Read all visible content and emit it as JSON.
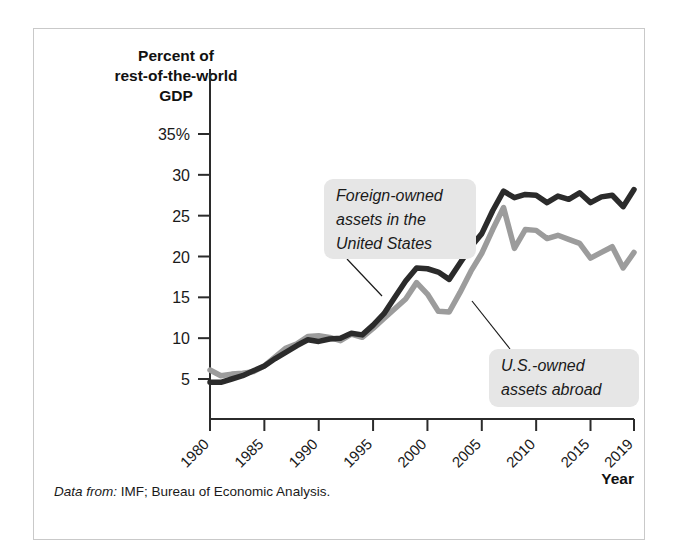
{
  "figure": {
    "source_lead": "Data from:",
    "source_text": "IMF; Bureau of Economic Analysis."
  },
  "chart_data": {
    "type": "line",
    "title": "",
    "ylabel": "Percent of rest-of-the-world GDP",
    "ylabel_lines": [
      "Percent of",
      "rest-of-the-world",
      "GDP"
    ],
    "xlabel": "Year",
    "ylim": [
      0,
      35
    ],
    "xlim": [
      1980,
      2019
    ],
    "grid": false,
    "legend_position": "annotations-on-plot",
    "ytick_labels": [
      "35%",
      "30",
      "25",
      "20",
      "15",
      "10",
      "5"
    ],
    "yticks": [
      35,
      30,
      25,
      20,
      15,
      10,
      5
    ],
    "xtick_labels": [
      "1980",
      "1985",
      "1990",
      "1995",
      "2000",
      "2005",
      "2010",
      "2015",
      "2019"
    ],
    "xticks": [
      1980,
      1985,
      1990,
      1995,
      2000,
      2005,
      2010,
      2015,
      2019
    ],
    "x": [
      1980,
      1981,
      1982,
      1983,
      1984,
      1985,
      1986,
      1987,
      1988,
      1989,
      1990,
      1991,
      1992,
      1993,
      1994,
      1995,
      1996,
      1997,
      1998,
      1999,
      2000,
      2001,
      2002,
      2003,
      2004,
      2005,
      2006,
      2007,
      2008,
      2009,
      2010,
      2011,
      2012,
      2013,
      2014,
      2015,
      2016,
      2017,
      2018,
      2019
    ],
    "series": [
      {
        "name": "Foreign-owned assets in the United States",
        "color": "#2b2b2b",
        "stroke_width": 5.5,
        "values": [
          4.6,
          4.6,
          5.0,
          5.4,
          6.0,
          6.6,
          7.5,
          8.3,
          9.1,
          9.8,
          9.6,
          9.9,
          10.0,
          10.6,
          10.4,
          11.6,
          13.0,
          15.0,
          17.0,
          18.6,
          18.5,
          18.1,
          17.2,
          19.2,
          21.2,
          22.8,
          25.6,
          28.0,
          27.2,
          27.6,
          27.5,
          26.6,
          27.4,
          27.0,
          27.8,
          26.6,
          27.3,
          27.5,
          26.1,
          28.2
        ]
      },
      {
        "name": "U.S.-owned assets abroad",
        "color": "#9c9c9c",
        "stroke_width": 5.5,
        "values": [
          6.1,
          5.4,
          5.6,
          5.7,
          5.9,
          6.6,
          7.7,
          8.8,
          9.3,
          10.2,
          10.3,
          10.1,
          9.7,
          10.5,
          10.1,
          11.2,
          12.4,
          13.6,
          14.8,
          16.8,
          15.4,
          13.3,
          13.2,
          15.6,
          18.2,
          20.4,
          23.3,
          26.0,
          21.0,
          23.3,
          23.2,
          22.2,
          22.6,
          22.1,
          21.6,
          19.8,
          20.5,
          21.2,
          18.6,
          20.5
        ]
      }
    ],
    "annotations": [
      {
        "id": "foreign-owned-callout",
        "lines": [
          "Foreign-owned",
          "assets in the",
          "United States"
        ],
        "box": {
          "x": 290,
          "y": 150,
          "w": 152,
          "h": 80
        },
        "leader": {
          "x1": 313,
          "y1": 230,
          "x2": 348,
          "y2": 267
        }
      },
      {
        "id": "us-owned-callout",
        "lines": [
          "U.S.-owned",
          "assets abroad"
        ],
        "box": {
          "x": 455,
          "y": 320,
          "w": 150,
          "h": 58
        },
        "leader": {
          "x1": 476,
          "y1": 320,
          "x2": 438,
          "y2": 272
        }
      }
    ]
  }
}
